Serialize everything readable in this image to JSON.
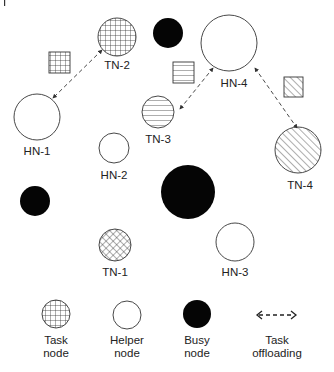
{
  "colors": {
    "stroke": "#333333",
    "busy_fill": "#050505",
    "background": "#ffffff"
  },
  "nodes": [
    {
      "id": "TN-2",
      "type": "task",
      "pattern": "grid",
      "label": "TN-2"
    },
    {
      "id": "HN-1",
      "type": "helper",
      "label": "HN-1"
    },
    {
      "id": "HN-2",
      "type": "helper",
      "label": "HN-2"
    },
    {
      "id": "TN-3",
      "type": "task",
      "pattern": "horizontal-lines",
      "label": "TN-3"
    },
    {
      "id": "HN-4",
      "type": "helper",
      "label": "HN-4"
    },
    {
      "id": "TN-4",
      "type": "task",
      "pattern": "diagonal-lines",
      "label": "TN-4"
    },
    {
      "id": "TN-1",
      "type": "task",
      "pattern": "cross-hatch",
      "label": "TN-1"
    },
    {
      "id": "HN-3",
      "type": "helper",
      "label": "HN-3"
    }
  ],
  "busy_nodes": 3,
  "offloading_links": [
    {
      "from": "TN-2",
      "to": "HN-1"
    },
    {
      "from": "TN-3",
      "to": "HN-4"
    },
    {
      "from": "TN-4",
      "to": "HN-4"
    }
  ],
  "legend": {
    "task": {
      "line1": "Task",
      "line2": "node"
    },
    "helper": {
      "line1": "Helper",
      "line2": "node"
    },
    "busy": {
      "line1": "Busy",
      "line2": "node"
    },
    "offloading": {
      "line1": "Task",
      "line2": "offloading",
      "glyph": "<---->"
    }
  }
}
